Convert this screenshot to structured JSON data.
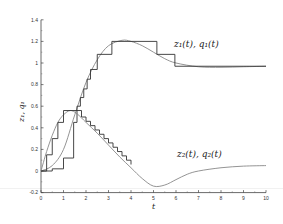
{
  "chart_data": {
    "type": "line",
    "title": "",
    "xlabel": "t",
    "ylabel": "z_1, q_1",
    "xlim": [
      0,
      10
    ],
    "ylim": [
      -0.2,
      1.4
    ],
    "xticks": [
      "0",
      "1",
      "2",
      "3",
      "4",
      "5",
      "6",
      "7",
      "8",
      "9",
      "10"
    ],
    "yticks": [
      "-0.2",
      "0",
      "0.2",
      "0.4",
      "0.6",
      "0.8",
      "1",
      "1.2",
      "1.4"
    ],
    "grid": false,
    "annotations": [
      {
        "text": "z₁(t), q₁(t)",
        "t": 5.5,
        "value": 1.15
      },
      {
        "text": "z₂(t), q₂(t)",
        "t": 5.5,
        "value": 0.25
      }
    ],
    "series": [
      {
        "name": "z1(t)",
        "style": "smooth",
        "t": [
          0,
          0.5,
          1.0,
          1.5,
          2.0,
          2.5,
          3.0,
          3.6,
          4.0,
          4.5,
          5.0,
          5.5,
          6.0,
          7.0,
          8.0,
          9.0,
          10.0
        ],
        "values": [
          0,
          0.05,
          0.2,
          0.52,
          0.82,
          1.03,
          1.16,
          1.21,
          1.2,
          1.16,
          1.1,
          1.04,
          1.0,
          0.965,
          0.96,
          0.965,
          0.97
        ]
      },
      {
        "name": "q1(t)",
        "style": "step",
        "t": [
          0,
          0.5,
          1.0,
          1.45,
          1.6,
          1.75,
          1.9,
          2.05,
          2.2,
          2.5,
          3.15,
          5.15,
          5.95,
          10.0
        ],
        "values": [
          0,
          0.02,
          0.12,
          0.45,
          0.6,
          0.68,
          0.76,
          0.85,
          0.94,
          1.08,
          1.2,
          1.08,
          0.97,
          0.97
        ]
      },
      {
        "name": "z2(t)",
        "style": "smooth",
        "t": [
          0,
          0.25,
          0.5,
          0.75,
          1.0,
          1.3,
          1.6,
          2.0,
          2.5,
          3.0,
          3.5,
          4.0,
          4.5,
          5.0,
          5.5,
          6.0,
          6.5,
          7.0,
          8.0,
          9.0,
          10.0
        ],
        "values": [
          0,
          0.18,
          0.33,
          0.45,
          0.52,
          0.56,
          0.53,
          0.45,
          0.35,
          0.24,
          0.13,
          0.03,
          -0.07,
          -0.14,
          -0.13,
          -0.08,
          -0.03,
          0.0,
          0.03,
          0.045,
          0.05
        ]
      },
      {
        "name": "q2(t)",
        "style": "step",
        "t": [
          0,
          0.25,
          0.5,
          0.75,
          1.0,
          1.6,
          1.8,
          2.0,
          2.2,
          2.4,
          2.6,
          2.8,
          3.0,
          3.2,
          3.4,
          3.6,
          3.8,
          4.0
        ],
        "values": [
          0,
          0.15,
          0.3,
          0.45,
          0.56,
          0.56,
          0.5,
          0.46,
          0.42,
          0.38,
          0.34,
          0.3,
          0.26,
          0.22,
          0.18,
          0.14,
          0.1,
          0.06
        ]
      }
    ]
  }
}
